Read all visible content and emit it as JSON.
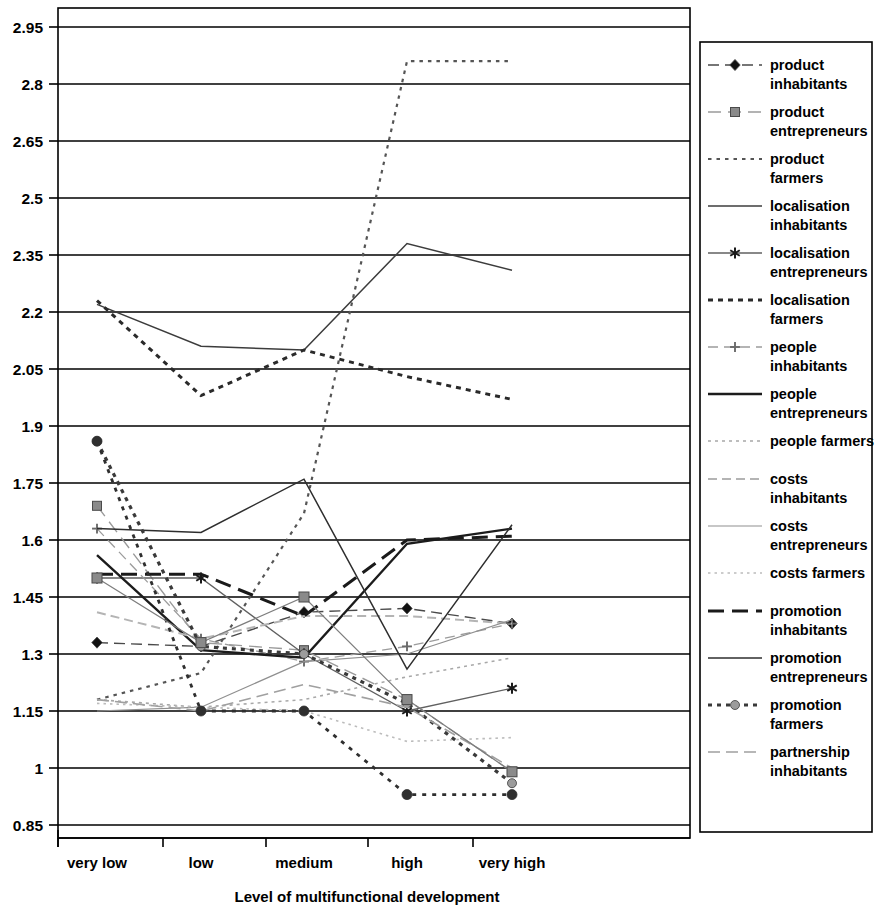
{
  "chart_data": {
    "type": "line",
    "title": "",
    "xlabel": "Level of multifunctional development",
    "ylabel": "",
    "categories": [
      "very low",
      "low",
      "medium",
      "high",
      "very high"
    ],
    "ylim": [
      0.85,
      2.95
    ],
    "ytick_step": 0.15,
    "yticks": [
      "0.85",
      "1",
      "1.15",
      "1.3",
      "1.45",
      "1.6",
      "1.75",
      "1.9",
      "2.05",
      "2.2",
      "2.35",
      "2.5",
      "2.65",
      "2.8",
      "2.95"
    ],
    "ytick_values": [
      0.85,
      1.0,
      1.15,
      1.3,
      1.45,
      1.6,
      1.75,
      1.9,
      2.05,
      2.2,
      2.35,
      2.5,
      2.65,
      2.8,
      2.95
    ],
    "grid": "horizontal",
    "legend_position": "right",
    "series": [
      {
        "name": "product inhabitants",
        "values": [
          1.33,
          1.32,
          1.41,
          1.42,
          1.38
        ],
        "color": "#4a4a4a",
        "dash": "11,6",
        "width": 1.4,
        "marker": "diamond",
        "marker_size": 9,
        "marker_fill": "#111111"
      },
      {
        "name": "product entrepreneurs",
        "values": [
          1.69,
          1.33,
          1.31,
          1.18,
          0.99
        ],
        "color": "#9a9a9a",
        "dash": "13,7",
        "width": 1.4,
        "marker": "square",
        "marker_size": 9,
        "marker_fill": "#8a8a8a"
      },
      {
        "name": "product farmers",
        "values": [
          1.18,
          1.25,
          1.67,
          2.86,
          2.86
        ],
        "color": "#555555",
        "dash": "3.5,5",
        "width": 2.2,
        "marker": "none",
        "marker_size": 7,
        "marker_fill": "#777777"
      },
      {
        "name": "localisation inhabitants",
        "values": [
          2.22,
          2.11,
          2.1,
          2.38,
          2.31
        ],
        "color": "#3c3c3c",
        "dash": "none",
        "width": 1.5,
        "marker": "none",
        "marker_size": 6,
        "marker_fill": "#3c3c3c"
      },
      {
        "name": "localisation entrepreneurs",
        "values": [
          1.5,
          1.5,
          1.3,
          1.15,
          1.21
        ],
        "color": "#606060",
        "dash": "none",
        "width": 1.3,
        "marker": "star",
        "marker_size": 10,
        "marker_fill": "#1a1a1a"
      },
      {
        "name": "localisation farmers",
        "values": [
          2.23,
          1.98,
          2.1,
          2.03,
          1.97
        ],
        "color": "#2a2a2a",
        "dash": "5,5",
        "width": 3.0,
        "marker": "none",
        "marker_size": 9,
        "marker_fill": "#2a2a2a"
      },
      {
        "name": "people inhabitants",
        "values": [
          1.63,
          1.34,
          1.28,
          1.32,
          1.38
        ],
        "color": "#9c9c9c",
        "dash": "10,6",
        "width": 1.3,
        "marker": "plus",
        "marker_size": 9,
        "marker_fill": "#6a6a6a"
      },
      {
        "name": "people entrepreneurs",
        "values": [
          1.56,
          1.31,
          1.29,
          1.59,
          1.63
        ],
        "color": "#1c1c1c",
        "dash": "none",
        "width": 2.4,
        "marker": "none",
        "marker_size": 6,
        "marker_fill": "#1c1c1c"
      },
      {
        "name": "people farmers",
        "values": [
          1.18,
          1.16,
          1.18,
          1.24,
          1.29
        ],
        "color": "#a8a8a8",
        "dash": "3,4",
        "width": 1.6,
        "marker": "none",
        "marker_size": 6,
        "marker_fill": "#a8a8a8"
      },
      {
        "name": "costs inhabitants",
        "values": [
          1.41,
          1.34,
          1.4,
          1.4,
          1.38
        ],
        "color": "#b4b4b4",
        "dash": "9,5",
        "width": 2.0,
        "marker": "none",
        "marker_size": 6,
        "marker_fill": "#b4b4b4"
      },
      {
        "name": "costs entrepreneurs",
        "values": [
          1.15,
          1.16,
          1.28,
          1.3,
          1.39
        ],
        "color": "#8f8f8f",
        "dash": "none",
        "width": 1.2,
        "marker": "none",
        "marker_size": 6,
        "marker_fill": "#8f8f8f"
      },
      {
        "name": "costs farmers",
        "values": [
          1.17,
          1.16,
          1.15,
          1.07,
          1.08
        ],
        "color": "#bcbcbc",
        "dash": "2.5,4",
        "width": 1.6,
        "marker": "none",
        "marker_size": 6,
        "marker_fill": "#bcbcbc"
      },
      {
        "name": "promotion inhabitants",
        "values": [
          1.51,
          1.51,
          1.4,
          1.6,
          1.61
        ],
        "color": "#1a1a1a",
        "dash": "16,8",
        "width": 3.0,
        "marker": "none",
        "marker_size": 6,
        "marker_fill": "#1a1a1a"
      },
      {
        "name": "promotion entrepreneurs",
        "values": [
          1.63,
          1.62,
          1.76,
          1.26,
          1.64
        ],
        "color": "#2e2e2e",
        "dash": "none",
        "width": 1.5,
        "marker": "none",
        "marker_size": 6,
        "marker_fill": "#2e2e2e"
      },
      {
        "name": "promotion farmers",
        "values": [
          1.86,
          1.32,
          1.3,
          1.17,
          0.96
        ],
        "color": "#3a3a3a",
        "dash": "4,5",
        "width": 3.2,
        "marker": "circle",
        "marker_size": 9,
        "marker_fill": "#9c9c9c"
      },
      {
        "name": "partnership inhabitants",
        "values": [
          1.18,
          1.15,
          1.22,
          1.16,
          1.0
        ],
        "color": "#a0a0a0",
        "dash": "12,6",
        "width": 1.6,
        "marker": "none",
        "marker_size": 6,
        "marker_fill": "#a0a0a0"
      }
    ],
    "extra_series": [
      {
        "name": "localisation farmers low-tail",
        "values": [
          1.86,
          1.15,
          1.15,
          0.93,
          0.93
        ],
        "color": "#2f2f2f",
        "dash": "4,6",
        "width": 2.8,
        "marker": "circle",
        "marker_size": 10,
        "marker_fill": "#2f2f2f"
      },
      {
        "name": "product entrepreneurs tail",
        "values": [
          1.5,
          1.33,
          1.45,
          1.18,
          0.99
        ],
        "color": "#7d7d7d",
        "dash": "none",
        "width": 1.2,
        "marker": "square",
        "marker_size": 10,
        "marker_fill": "#8a8a8a"
      }
    ]
  },
  "legend": {
    "entries": [
      "product inhabitants",
      "product entrepreneurs",
      "product farmers",
      "localisation inhabitants",
      "localisation entrepreneurs",
      "localisation farmers",
      "people inhabitants",
      "people entrepreneurs",
      "people farmers",
      "costs inhabitants",
      "costs entrepreneurs",
      "costs farmers",
      "promotion inhabitants",
      "promotion entrepreneurs",
      "promotion farmers",
      "partnership inhabitants"
    ]
  }
}
